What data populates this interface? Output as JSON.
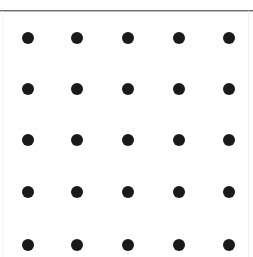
{
  "figure": {
    "width": 253,
    "height": 257,
    "background_color": "#fefefe",
    "dot_color": "#1a1a1a",
    "rule_color": "#6e6e6e",
    "edge_color": "#f0f0f0"
  },
  "chart_data": {
    "type": "scatter",
    "title": "",
    "xlabel": "",
    "ylabel": "",
    "grid": false,
    "legend": null,
    "rows": 5,
    "columns": 5,
    "dot_diameter": 12,
    "column_centers": [
      28,
      77,
      128,
      179,
      229
    ],
    "row_centers": [
      38,
      89,
      140,
      192,
      245
    ],
    "points": [
      {
        "x": 28,
        "y": 38,
        "r": 6
      },
      {
        "x": 77,
        "y": 38,
        "r": 6
      },
      {
        "x": 128,
        "y": 38,
        "r": 6
      },
      {
        "x": 179,
        "y": 38,
        "r": 6
      },
      {
        "x": 229,
        "y": 38,
        "r": 6
      },
      {
        "x": 28,
        "y": 89,
        "r": 6
      },
      {
        "x": 77,
        "y": 89,
        "r": 6
      },
      {
        "x": 128,
        "y": 89,
        "r": 6
      },
      {
        "x": 179,
        "y": 89,
        "r": 6
      },
      {
        "x": 229,
        "y": 89,
        "r": 6
      },
      {
        "x": 28,
        "y": 140,
        "r": 6
      },
      {
        "x": 77,
        "y": 140,
        "r": 6
      },
      {
        "x": 128,
        "y": 140,
        "r": 6
      },
      {
        "x": 179,
        "y": 140,
        "r": 6
      },
      {
        "x": 229,
        "y": 140,
        "r": 6
      },
      {
        "x": 28,
        "y": 192,
        "r": 6
      },
      {
        "x": 77,
        "y": 192,
        "r": 6
      },
      {
        "x": 128,
        "y": 192,
        "r": 6
      },
      {
        "x": 179,
        "y": 192,
        "r": 6
      },
      {
        "x": 229,
        "y": 192,
        "r": 6
      },
      {
        "x": 28,
        "y": 245,
        "r": 6
      },
      {
        "x": 77,
        "y": 245,
        "r": 6
      },
      {
        "x": 128,
        "y": 245,
        "r": 6
      },
      {
        "x": 179,
        "y": 245,
        "r": 6
      },
      {
        "x": 229,
        "y": 245,
        "r": 6
      }
    ]
  }
}
